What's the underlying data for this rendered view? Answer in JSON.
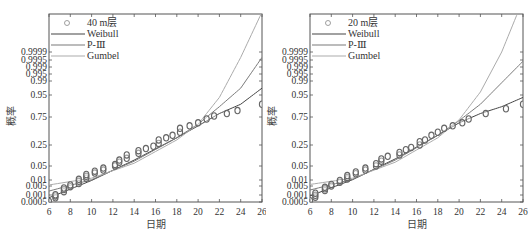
{
  "chart_data": [
    {
      "type": "scatter",
      "panel": "left",
      "title": "",
      "xlabel": "日期",
      "ylabel": "概率",
      "xlim": [
        6,
        26
      ],
      "x_ticks": [
        "6",
        "8",
        "10",
        "12",
        "14",
        "16",
        "18",
        "20",
        "22",
        "24",
        "26"
      ],
      "y_scale": "probability",
      "y_ticks": [
        "0.9999",
        "0.9995",
        "0.999",
        "0.995",
        "0.99",
        "0.95",
        "0.75",
        "0.25",
        "0.05",
        "0.01",
        "0.005",
        "0.001",
        "0.0005"
      ],
      "legend": [
        "40 m层",
        "Weibull",
        "P-Ⅲ",
        "Gumbel"
      ],
      "legend_position": "upper left",
      "series": [
        {
          "name": "40 m层",
          "kind": "markers",
          "marker": "circle",
          "x": [
            6.0,
            6.6,
            6.6,
            6.6,
            7.4,
            7.4,
            7.4,
            8.0,
            8.0,
            8.8,
            8.8,
            8.8,
            9.5,
            9.5,
            9.5,
            10.3,
            10.3,
            11.1,
            11.1,
            12.2,
            12.2,
            12.6,
            12.6,
            13.3,
            13.3,
            14.4,
            14.4,
            15.1,
            15.8,
            16.3,
            16.3,
            17.0,
            17.6,
            18.3,
            18.3,
            19.2,
            20.0,
            20.8,
            21.5,
            22.7,
            23.7,
            26.0
          ],
          "y": [
            0.0007,
            0.004,
            0.008,
            0.012,
            0.03,
            0.05,
            0.07,
            0.09,
            0.12,
            0.15,
            0.2,
            0.25,
            0.28,
            0.33,
            0.38,
            0.42,
            0.47,
            0.5,
            0.55,
            0.6,
            0.63,
            0.68,
            0.72,
            0.75,
            0.8,
            0.82,
            0.85,
            0.87,
            0.89,
            0.91,
            0.93,
            0.94,
            0.95,
            0.96,
            0.97,
            0.975,
            0.98,
            0.985,
            0.988,
            0.99,
            0.992,
            0.995
          ]
        },
        {
          "name": "Weibull",
          "kind": "line",
          "color": "#444444",
          "x": [
            6,
            10,
            14,
            18,
            20,
            22,
            24,
            26
          ],
          "y": [
            0.004,
            0.22,
            0.72,
            0.94,
            0.975,
            0.99,
            0.995,
            0.9985
          ]
        },
        {
          "name": "P-Ⅲ",
          "kind": "line",
          "color": "#777777",
          "x": [
            6,
            10,
            14,
            18,
            20,
            22,
            24,
            26
          ],
          "y": [
            0.035,
            0.24,
            0.7,
            0.94,
            0.978,
            0.994,
            0.9985,
            0.99985
          ]
        },
        {
          "name": "Gumbel",
          "kind": "line",
          "color": "#aaaaaa",
          "x": [
            6,
            10,
            14,
            18,
            20,
            22,
            24,
            26
          ],
          "y": [
            0.12,
            0.28,
            0.66,
            0.93,
            0.978,
            0.997,
            0.99985,
            0.999995
          ]
        }
      ]
    },
    {
      "type": "scatter",
      "panel": "right",
      "title": "",
      "xlabel": "日期",
      "ylabel": "概率",
      "xlim": [
        6,
        26
      ],
      "x_ticks": [
        "6",
        "8",
        "10",
        "12",
        "14",
        "16",
        "18",
        "20",
        "22",
        "24",
        "26"
      ],
      "y_scale": "probability",
      "y_ticks": [
        "0.9999",
        "0.9995",
        "0.999",
        "0.995",
        "0.99",
        "0.95",
        "0.75",
        "0.25",
        "0.05",
        "0.01",
        "0.005",
        "0.001",
        "0.0005"
      ],
      "legend": [
        "20 m层",
        "Weibull",
        "P-Ⅲ",
        "Gumbel"
      ],
      "legend_position": "upper left",
      "series": [
        {
          "name": "20 m层",
          "kind": "markers",
          "marker": "circle",
          "x": [
            6.0,
            6.5,
            6.5,
            6.5,
            7.4,
            7.4,
            7.4,
            8.0,
            8.0,
            8.8,
            8.8,
            9.5,
            9.5,
            9.5,
            10.3,
            10.3,
            11.2,
            11.2,
            12.2,
            12.2,
            12.7,
            12.7,
            13.3,
            14.4,
            14.4,
            15.0,
            15.5,
            16.3,
            16.3,
            16.8,
            17.4,
            18.0,
            18.6,
            19.4,
            20.3,
            20.9,
            22.5,
            24.4,
            26.0
          ],
          "y": [
            0.001,
            0.005,
            0.01,
            0.02,
            0.04,
            0.06,
            0.08,
            0.1,
            0.13,
            0.18,
            0.22,
            0.26,
            0.3,
            0.35,
            0.4,
            0.45,
            0.5,
            0.55,
            0.6,
            0.65,
            0.7,
            0.74,
            0.78,
            0.8,
            0.83,
            0.86,
            0.88,
            0.9,
            0.92,
            0.93,
            0.95,
            0.96,
            0.97,
            0.975,
            0.98,
            0.985,
            0.99,
            0.993,
            0.995
          ]
        },
        {
          "name": "Weibull",
          "kind": "line",
          "color": "#444444",
          "x": [
            6,
            10,
            14,
            18,
            20,
            22,
            24,
            26
          ],
          "y": [
            0.008,
            0.24,
            0.74,
            0.95,
            0.98,
            0.99,
            0.994,
            0.997
          ]
        },
        {
          "name": "P-Ⅲ",
          "kind": "line",
          "color": "#777777",
          "x": [
            6,
            10,
            14,
            18,
            20,
            22,
            24,
            26
          ],
          "y": [
            0.045,
            0.25,
            0.72,
            0.95,
            0.983,
            0.995,
            0.999,
            0.9998
          ]
        },
        {
          "name": "Gumbel",
          "kind": "line",
          "color": "#aaaaaa",
          "x": [
            6,
            10,
            14,
            18,
            20,
            22,
            24,
            26
          ],
          "y": [
            0.13,
            0.28,
            0.68,
            0.94,
            0.984,
            0.998,
            0.9999,
            0.999998
          ]
        }
      ]
    }
  ],
  "left": {
    "legend_label_0": "40 m层",
    "legend_label_1": "Weibull",
    "legend_label_2": "P-Ⅲ",
    "legend_label_3": "Gumbel",
    "xlabel": "日期",
    "ylabel": "概率"
  },
  "right": {
    "legend_label_0": "20 m层",
    "legend_label_1": "Weibull",
    "legend_label_2": "P-Ⅲ",
    "legend_label_3": "Gumbel",
    "xlabel": "日期",
    "ylabel": "概率"
  },
  "colors": {
    "weibull": "#444444",
    "p3": "#7a7a7a",
    "gumbel": "#ababab",
    "marker": "#666666",
    "axis": "#555555"
  }
}
